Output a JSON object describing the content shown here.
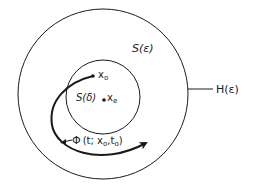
{
  "diagram": {
    "colors": {
      "stroke": "#1a1a1a",
      "background": "#ffffff"
    },
    "outer_circle": {
      "label_inside": "S(ε)",
      "label_outside": "H(ε)"
    },
    "inner_circle": {
      "label": "S(δ)"
    },
    "points": {
      "start": {
        "label": "x",
        "subscript": "o"
      },
      "equilibrium": {
        "label": "x",
        "subscript": "e"
      }
    },
    "trajectory": {
      "symbol": "Φ",
      "args_pre": "(t; x",
      "sub1": "o",
      "args_mid": ",t",
      "sub2": "o",
      "args_post": ")"
    }
  }
}
